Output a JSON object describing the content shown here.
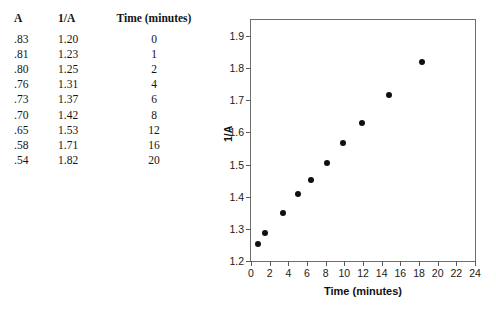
{
  "table": {
    "headers": [
      "A",
      "1/A",
      "Time (minutes)"
    ],
    "rows": [
      {
        "a": ".83",
        "inv_a": "1.20",
        "time": "0"
      },
      {
        "a": ".81",
        "inv_a": "1.23",
        "time": "1"
      },
      {
        "a": ".80",
        "inv_a": "1.25",
        "time": "2"
      },
      {
        "a": ".76",
        "inv_a": "1.31",
        "time": "4"
      },
      {
        "a": ".73",
        "inv_a": "1.37",
        "time": "6"
      },
      {
        "a": ".70",
        "inv_a": "1.42",
        "time": "8"
      },
      {
        "a": ".65",
        "inv_a": "1.53",
        "time": "12"
      },
      {
        "a": ".58",
        "inv_a": "1.71",
        "time": "16"
      },
      {
        "a": ".54",
        "inv_a": "1.82",
        "time": "20"
      }
    ]
  },
  "chart_data": {
    "type": "scatter",
    "title": "",
    "xlabel": "Time (minutes)",
    "ylabel": "1/A",
    "xlim": [
      0,
      24
    ],
    "ylim": [
      1.2,
      1.95
    ],
    "xticks": [
      0,
      2,
      4,
      6,
      8,
      10,
      12,
      14,
      16,
      18,
      20,
      22,
      24
    ],
    "xticklabels": [
      "0",
      "2",
      "4",
      "6",
      "8",
      "10",
      "12",
      "14",
      "16",
      "18",
      "20",
      "22",
      "24"
    ],
    "yticks": [
      1.2,
      1.3,
      1.4,
      1.5,
      1.6,
      1.7,
      1.8,
      1.9
    ],
    "yticklabels": [
      "1.2",
      "1.3",
      "1.4",
      "1.5",
      "1.6",
      "1.7",
      "1.8",
      "1.9"
    ],
    "grid": false,
    "legend": false,
    "marker": "filled-circle",
    "marker_color": "#101010",
    "series": [
      {
        "name": "1/A vs Time",
        "x": [
          0.7,
          1.5,
          3.4,
          5.0,
          6.4,
          8.1,
          9.9,
          11.9,
          14.8,
          18.3
        ],
        "y": [
          1.252,
          1.287,
          1.35,
          1.407,
          1.451,
          1.504,
          1.567,
          1.63,
          1.718,
          1.819
        ]
      }
    ]
  },
  "colors": {
    "axis": "#6d6d6d",
    "tick": "#5a5a5a",
    "text": "#111111",
    "marker": "#101010",
    "background": "#ffffff"
  }
}
